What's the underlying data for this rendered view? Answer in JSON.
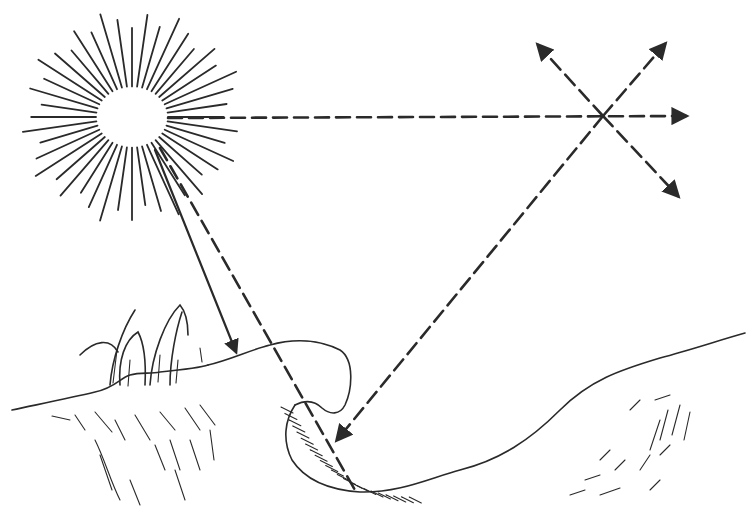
{
  "figure": {
    "description": "Line drawing of sunlight: direct and diffuse radiation reaching the ground, scattering in the atmosphere and reflection from a surface",
    "colors": {
      "ink": "#2a2a2a",
      "background": "#ffffff"
    },
    "elements": {
      "sun": "sun-icon",
      "direct_ray": "solid arrow from sun to ground surface",
      "scatter_ray": "dashed horizontal ray from sun to scattering point",
      "scatter_point": "point in sky where dashed arrows diverge in four directions",
      "diffuse_ray": "dashed arrow from scattering point down to the ground",
      "second_ray": "dashed ray from sun into the hollow",
      "ground_left": "grassy bank on the left",
      "hollow": "curved depression with hatched shading",
      "ground_right": "rising slope on the right"
    }
  }
}
